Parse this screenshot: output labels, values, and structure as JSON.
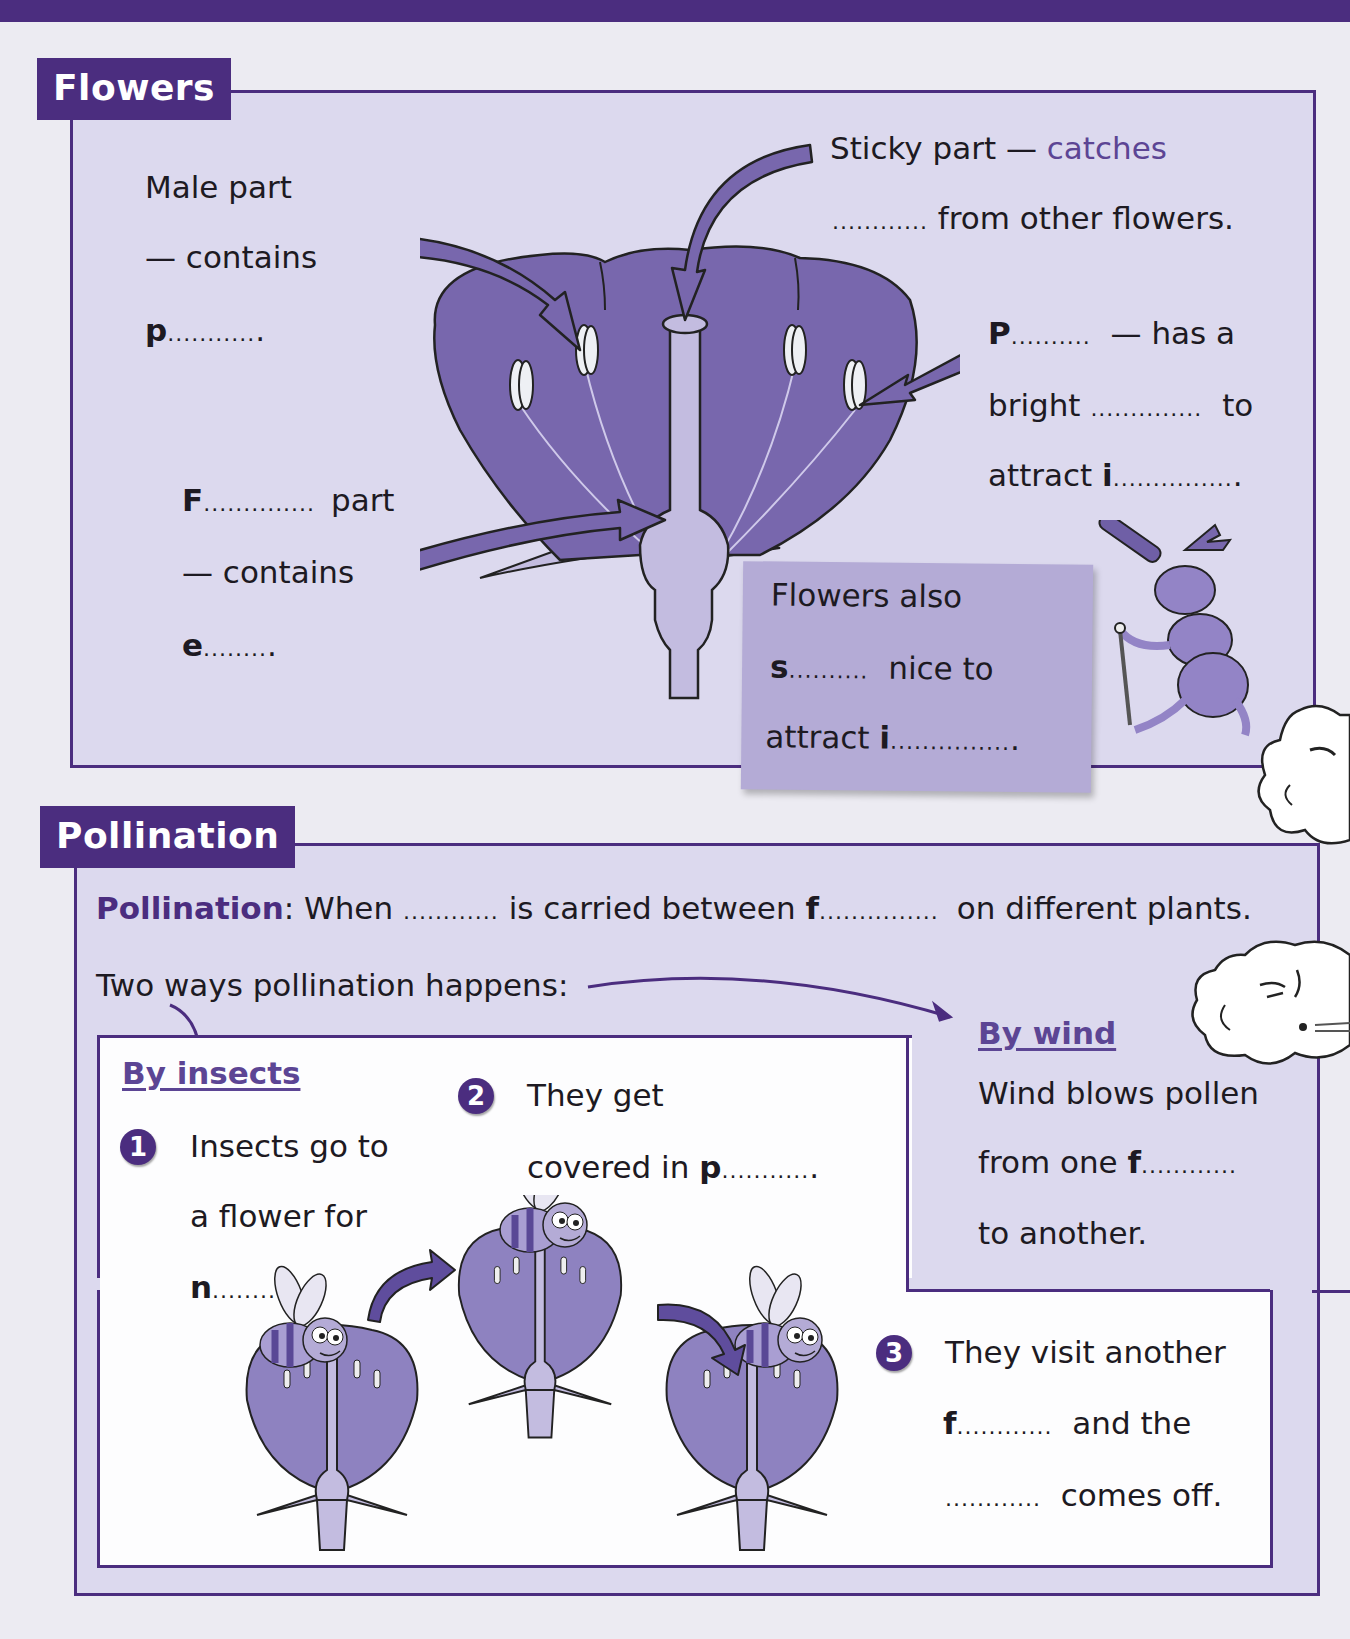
{
  "colors": {
    "brand": "#4b2d7f",
    "panel": "#dcd9ee",
    "callout": "#b4abd6",
    "flower": "#7867ad",
    "accent_text": "#5c4594"
  },
  "flowers": {
    "section_label": "Flowers",
    "male_part": {
      "line1": "Male part",
      "line2": "— contains",
      "letter": "p",
      "blank": "...........",
      "end": "."
    },
    "sticky_part": {
      "prefix": "Sticky part —",
      "hint": "catches",
      "blank": "............",
      "suffix": "from other flowers."
    },
    "petals": {
      "letter": "P",
      "blank": "..........",
      "after": "— has a",
      "line2_prefix": "bright",
      "line2_blank": "..............",
      "line2_suffix": "to",
      "line3_prefix": "attract",
      "line3_letter": "i",
      "line3_blank": "...............",
      "line3_end": "."
    },
    "female_part": {
      "letter": "F",
      "blank": "..............",
      "after": "part",
      "line2": "— contains",
      "line3_letter": "e",
      "line3_blank": "........",
      "line3_end": "."
    },
    "callout": {
      "line1": "Flowers also",
      "line2_letter": "s",
      "line2_blank": "..........",
      "line2_suffix": "nice to",
      "line3_prefix": "attract",
      "line3_letter": "i",
      "line3_blank": "...............",
      "line3_end": "."
    }
  },
  "pollination": {
    "section_label": "Pollination",
    "definition": {
      "term": "Pollination",
      "colon": ":",
      "p1": "When",
      "blank1": "............",
      "p2": "is carried between",
      "letter": "f",
      "blank2": "...............",
      "p3": "on different plants."
    },
    "two_ways": "Two ways pollination happens:",
    "by_insects": {
      "heading": "By insects",
      "steps": [
        {
          "num": "1",
          "line1": "Insects go to",
          "line2": "a flower for",
          "letter": "n",
          "blank": "............",
          "end": "."
        },
        {
          "num": "2",
          "line1": "They get",
          "line2_prefix": "covered in",
          "letter": "p",
          "blank": "...........",
          "end": "."
        },
        {
          "num": "3",
          "line1": "They visit another",
          "letter": "f",
          "blank": "............",
          "line2_suffix": "and the",
          "line3_blank": "............",
          "line3_suffix": "comes off."
        }
      ]
    },
    "by_wind": {
      "heading": "By wind",
      "line1": "Wind blows pollen",
      "line2_prefix": "from one",
      "letter": "f",
      "blank": "............",
      "line3": "to another."
    }
  },
  "icons": [
    "flower-diagram",
    "arrow-icon",
    "beetle-with-telescope",
    "wind-cloud-face",
    "bee-on-flower"
  ]
}
